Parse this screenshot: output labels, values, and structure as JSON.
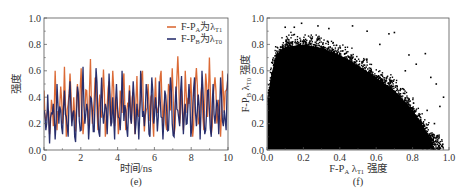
{
  "chart_data": [
    {
      "id": "e",
      "type": "line",
      "caption": "(e)",
      "title": "",
      "xlabel": "时间/ns",
      "ylabel": "强度",
      "xlim": [
        0,
        10
      ],
      "ylim": [
        0.0,
        1.0
      ],
      "xticks": [
        "0",
        "2",
        "4",
        "6",
        "8",
        "10"
      ],
      "yticks": [
        "0.0",
        "0.2",
        "0.4",
        "0.6",
        "0.8",
        "1.0"
      ],
      "grid": false,
      "legend_position": "upper right",
      "series": [
        {
          "name": "F-PA为λT1",
          "legend_main": "F-P",
          "legend_sub1": "A",
          "legend_mid": "为λ",
          "legend_sub2": "T1",
          "color": "#d9622b",
          "values": [
            0.45,
            0.22,
            0.31,
            0.12,
            0.38,
            0.18,
            0.6,
            0.15,
            0.28,
            0.48,
            0.2,
            0.63,
            0.1,
            0.35,
            0.58,
            0.22,
            0.4,
            0.14,
            0.5,
            0.25,
            0.62,
            0.12,
            0.3,
            0.45,
            0.18,
            0.69,
            0.2,
            0.38,
            0.55,
            0.15,
            0.42,
            0.25,
            0.61,
            0.1,
            0.33,
            0.52,
            0.2,
            0.6,
            0.18,
            0.4,
            0.12,
            0.45,
            0.28,
            0.58,
            0.15,
            0.35,
            0.49,
            0.2,
            0.44,
            0.12,
            0.56,
            0.25,
            0.38,
            0.6,
            0.14,
            0.3,
            0.5,
            0.22,
            0.42,
            0.1,
            0.55,
            0.28,
            0.35,
            0.6,
            0.18,
            0.4,
            0.15,
            0.5,
            0.3,
            0.62,
            0.12,
            0.38,
            0.71,
            0.2,
            0.45,
            0.15,
            0.6,
            0.28,
            0.35,
            0.55,
            0.1,
            0.42,
            0.62,
            0.2,
            0.3,
            0.5,
            0.15,
            0.58,
            0.25,
            0.7,
            0.12,
            0.4,
            0.55,
            0.2,
            0.38,
            0.1,
            0.6,
            0.28,
            0.45,
            0.57
          ]
        },
        {
          "name": "F-PB为λT0",
          "legend_main": "F-P",
          "legend_sub1": "B",
          "legend_mid": "为λ",
          "legend_sub2": "T0",
          "color": "#1e2566",
          "values": [
            0.3,
            0.15,
            0.42,
            0.05,
            0.28,
            0.35,
            0.08,
            0.5,
            0.2,
            0.3,
            0.12,
            0.45,
            0.25,
            0.1,
            0.52,
            0.18,
            0.3,
            0.06,
            0.48,
            0.22,
            0.15,
            0.63,
            0.2,
            0.35,
            0.08,
            0.4,
            0.3,
            0.14,
            0.62,
            0.25,
            0.1,
            0.55,
            0.2,
            0.35,
            0.12,
            0.58,
            0.18,
            0.4,
            0.08,
            0.5,
            0.25,
            0.15,
            0.6,
            0.22,
            0.3,
            0.1,
            0.45,
            0.2,
            0.52,
            0.12,
            0.35,
            0.08,
            0.6,
            0.25,
            0.18,
            0.5,
            0.3,
            0.1,
            0.55,
            0.2,
            0.4,
            0.14,
            0.52,
            0.25,
            0.08,
            0.45,
            0.3,
            0.15,
            0.55,
            0.2,
            0.1,
            0.48,
            0.3,
            0.18,
            0.56,
            0.12,
            0.35,
            0.2,
            0.5,
            0.1,
            0.3,
            0.55,
            0.18,
            0.42,
            0.08,
            0.6,
            0.25,
            0.15,
            0.45,
            0.3,
            0.1,
            0.5,
            0.2,
            0.38,
            0.12,
            0.55,
            0.22,
            0.3,
            0.15,
            0.58
          ]
        }
      ]
    },
    {
      "id": "f",
      "type": "scatter",
      "caption": "(f)",
      "title": "",
      "xlabel": "F-PA λT1 强度",
      "xlabel_parts": {
        "main": "F-P",
        "sub1": "A",
        "mid": " λ",
        "sub2": "T1",
        "tail": " 强度"
      },
      "ylabel": "F-PB λT0 强度",
      "ylabel_parts": {
        "main": "F-P",
        "sub1": "B",
        "mid": " λ",
        "sub2": "T0",
        "tail": " 强度"
      },
      "xlim": [
        0.0,
        1.0
      ],
      "ylim": [
        0.0,
        1.0
      ],
      "xticks": [
        "0.0",
        "0.2",
        "0.4",
        "0.6",
        "0.8",
        "1.0"
      ],
      "yticks": [
        "0.0",
        "0.2",
        "0.4",
        "0.6",
        "0.8",
        "1.0"
      ],
      "grid": false,
      "marker_color": "#000000",
      "envelope_description": "Dense black point cloud filling x 0.0–0.85, y 0.0–0.8; upper boundary decreasing from ~0.8 near x=0.2 to ~0.2 near x=0.9; sparse outliers up to (0.2,0.96), (0.9,0.5), (0.97,0.4)",
      "envelope": [
        [
          0.02,
          0.55
        ],
        [
          0.05,
          0.72
        ],
        [
          0.1,
          0.78
        ],
        [
          0.2,
          0.8
        ],
        [
          0.3,
          0.77
        ],
        [
          0.4,
          0.72
        ],
        [
          0.5,
          0.64
        ],
        [
          0.6,
          0.55
        ],
        [
          0.7,
          0.45
        ],
        [
          0.8,
          0.3
        ],
        [
          0.85,
          0.2
        ],
        [
          0.9,
          0.08
        ],
        [
          0.92,
          0.0
        ]
      ],
      "outliers": [
        [
          0.15,
          0.93
        ],
        [
          0.19,
          0.96
        ],
        [
          0.28,
          0.94
        ],
        [
          0.34,
          0.92
        ],
        [
          0.47,
          0.94
        ],
        [
          0.55,
          0.9
        ],
        [
          0.67,
          0.88
        ],
        [
          0.7,
          0.89
        ],
        [
          0.87,
          0.73
        ],
        [
          0.82,
          0.65
        ],
        [
          0.9,
          0.55
        ],
        [
          0.93,
          0.5
        ],
        [
          0.97,
          0.4
        ],
        [
          0.95,
          0.33
        ],
        [
          0.92,
          0.2
        ],
        [
          0.88,
          0.3
        ],
        [
          0.76,
          0.6
        ],
        [
          0.1,
          0.93
        ],
        [
          0.62,
          0.8
        ],
        [
          0.78,
          0.72
        ]
      ]
    }
  ]
}
